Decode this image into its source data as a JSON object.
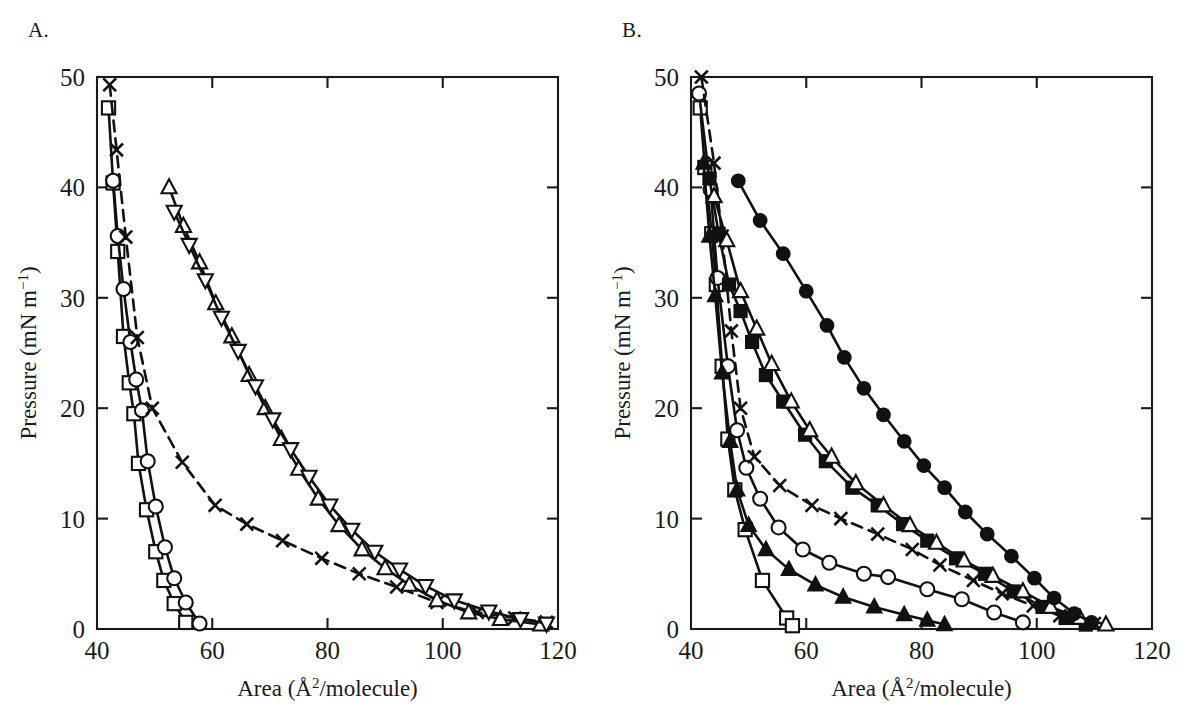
{
  "figure": {
    "background_color": "#ffffff",
    "ink_color": "#111111",
    "panels": [
      {
        "id": "A",
        "label": "A."
      },
      {
        "id": "B",
        "label": "B."
      }
    ]
  },
  "chart_data": [
    {
      "panel": "A",
      "type": "line",
      "title": "",
      "xlabel": "Area (Å²/molecule)",
      "xlabel_parts": {
        "pre": "Area (Å",
        "sup": "2",
        "post": "/molecule)"
      },
      "ylabel": "Pressure (mN m⁻¹)",
      "ylabel_parts": {
        "pre": "Pressure (mN m",
        "sup": "−1",
        "post": ")"
      },
      "xlim": [
        40,
        120
      ],
      "ylim": [
        0,
        50
      ],
      "xticks": [
        40,
        60,
        80,
        100,
        120
      ],
      "yticks": [
        0,
        10,
        20,
        30,
        40,
        50
      ],
      "grid": false,
      "legend": "none",
      "ticks_direction": "in",
      "frame": "box",
      "series": [
        {
          "name": "open-square-isotherm",
          "marker": "open-square",
          "linestyle": "solid",
          "points": [
            [
              42.0,
              47.2
            ],
            [
              42.8,
              40.4
            ],
            [
              43.6,
              34.2
            ],
            [
              44.6,
              26.5
            ],
            [
              45.6,
              22.3
            ],
            [
              46.4,
              19.5
            ],
            [
              47.2,
              15.0
            ],
            [
              48.6,
              10.8
            ],
            [
              50.2,
              7.0
            ],
            [
              51.6,
              4.4
            ],
            [
              53.4,
              2.3
            ],
            [
              55.4,
              0.6
            ]
          ]
        },
        {
          "name": "open-circle-isotherm",
          "marker": "open-circle",
          "linestyle": "solid",
          "points": [
            [
              42.8,
              40.6
            ],
            [
              43.6,
              35.6
            ],
            [
              44.6,
              30.8
            ],
            [
              45.8,
              26.0
            ],
            [
              46.8,
              22.6
            ],
            [
              47.8,
              19.8
            ],
            [
              48.8,
              15.2
            ],
            [
              50.2,
              11.1
            ],
            [
              51.8,
              7.4
            ],
            [
              53.4,
              4.6
            ],
            [
              55.4,
              2.4
            ],
            [
              57.8,
              0.5
            ]
          ]
        },
        {
          "name": "cross-isotherm",
          "marker": "cross",
          "linestyle": "dashed",
          "points": [
            [
              42.2,
              49.3
            ],
            [
              43.4,
              43.4
            ],
            [
              45.0,
              35.5
            ],
            [
              47.0,
              26.4
            ],
            [
              49.6,
              20.0
            ],
            [
              54.8,
              15.1
            ],
            [
              60.5,
              11.2
            ],
            [
              66.0,
              9.5
            ],
            [
              72.2,
              8.0
            ],
            [
              79.0,
              6.4
            ],
            [
              85.5,
              5.0
            ],
            [
              92.0,
              3.8
            ],
            [
              99.0,
              2.4
            ],
            [
              106.0,
              1.5
            ],
            [
              112.5,
              1.0
            ],
            [
              118.0,
              0.6
            ]
          ]
        },
        {
          "name": "open-up-triangle-isotherm",
          "marker": "open-triangle-up",
          "linestyle": "solid",
          "points": [
            [
              52.5,
              40.0
            ],
            [
              55.0,
              36.5
            ],
            [
              57.8,
              33.2
            ],
            [
              60.6,
              29.5
            ],
            [
              63.4,
              26.5
            ],
            [
              66.4,
              23.0
            ],
            [
              69.2,
              20.0
            ],
            [
              72.0,
              17.2
            ],
            [
              75.0,
              14.5
            ],
            [
              78.4,
              11.8
            ],
            [
              82.0,
              9.4
            ],
            [
              86.0,
              7.2
            ],
            [
              90.0,
              5.5
            ],
            [
              94.2,
              4.0
            ],
            [
              99.0,
              2.6
            ],
            [
              104.5,
              1.5
            ],
            [
              110.0,
              0.9
            ],
            [
              117.0,
              0.4
            ]
          ]
        },
        {
          "name": "open-down-triangle-isotherm",
          "marker": "open-triangle-down",
          "linestyle": "solid",
          "points": [
            [
              53.4,
              37.8
            ],
            [
              56.0,
              34.8
            ],
            [
              58.8,
              31.6
            ],
            [
              61.6,
              28.2
            ],
            [
              64.5,
              25.2
            ],
            [
              67.5,
              22.0
            ],
            [
              70.5,
              19.0
            ],
            [
              73.6,
              16.3
            ],
            [
              76.8,
              13.8
            ],
            [
              80.4,
              11.2
            ],
            [
              84.2,
              9.0
            ],
            [
              88.2,
              7.0
            ],
            [
              92.5,
              5.4
            ],
            [
              97.0,
              3.9
            ],
            [
              102.0,
              2.6
            ],
            [
              108.0,
              1.6
            ],
            [
              113.5,
              0.9
            ],
            [
              118.0,
              0.5
            ]
          ]
        }
      ]
    },
    {
      "panel": "B",
      "type": "line",
      "title": "",
      "xlabel": "Area (Å²/molecule)",
      "xlabel_parts": {
        "pre": "Area (Å",
        "sup": "2",
        "post": "/molecule)"
      },
      "ylabel": "Pressure (mN m⁻¹)",
      "ylabel_parts": {
        "pre": "Pressure (mN m",
        "sup": "−1",
        "post": ")"
      },
      "xlim": [
        40,
        120
      ],
      "ylim": [
        0,
        50
      ],
      "xticks": [
        40,
        60,
        80,
        100,
        120
      ],
      "yticks": [
        0,
        10,
        20,
        30,
        40,
        50
      ],
      "grid": false,
      "legend": "none",
      "ticks_direction": "in",
      "frame": "box",
      "series": [
        {
          "name": "open-square-isotherm",
          "marker": "open-square",
          "linestyle": "solid",
          "points": [
            [
              41.6,
              47.2
            ],
            [
              42.4,
              41.8
            ],
            [
              43.6,
              35.8
            ],
            [
              44.4,
              31.2
            ],
            [
              45.4,
              23.8
            ],
            [
              46.4,
              17.2
            ],
            [
              47.6,
              12.6
            ],
            [
              49.4,
              9.0
            ],
            [
              52.4,
              4.4
            ],
            [
              56.6,
              1.0
            ],
            [
              57.6,
              0.3
            ]
          ]
        },
        {
          "name": "open-circle-isotherm",
          "marker": "open-circle",
          "linestyle": "solid",
          "points": [
            [
              41.4,
              48.5
            ],
            [
              43.4,
              39.8
            ],
            [
              44.6,
              31.8
            ],
            [
              46.4,
              23.8
            ],
            [
              48.0,
              18.0
            ],
            [
              49.6,
              14.6
            ],
            [
              52.0,
              11.8
            ],
            [
              55.2,
              9.2
            ],
            [
              59.4,
              7.2
            ],
            [
              64.0,
              6.0
            ],
            [
              70.0,
              5.0
            ],
            [
              74.2,
              4.7
            ],
            [
              81.0,
              3.6
            ],
            [
              87.0,
              2.7
            ],
            [
              92.6,
              1.5
            ],
            [
              97.6,
              0.6
            ]
          ]
        },
        {
          "name": "cross-isotherm",
          "marker": "cross",
          "linestyle": "dashed",
          "points": [
            [
              41.8,
              50.0
            ],
            [
              44.0,
              42.2
            ],
            [
              45.4,
              35.6
            ],
            [
              47.0,
              27.0
            ],
            [
              48.6,
              20.0
            ],
            [
              51.0,
              15.6
            ],
            [
              55.4,
              13.0
            ],
            [
              61.0,
              11.2
            ],
            [
              66.0,
              10.0
            ],
            [
              72.4,
              8.6
            ],
            [
              78.4,
              7.2
            ],
            [
              83.2,
              5.8
            ],
            [
              89.0,
              4.4
            ],
            [
              94.0,
              3.2
            ],
            [
              99.4,
              2.1
            ],
            [
              104.0,
              1.2
            ],
            [
              110.0,
              0.5
            ]
          ]
        },
        {
          "name": "filled-triangle-isotherm",
          "marker": "filled-triangle-up",
          "linestyle": "solid",
          "points": [
            [
              42.2,
              42.2
            ],
            [
              43.2,
              35.6
            ],
            [
              44.2,
              30.2
            ],
            [
              45.4,
              23.2
            ],
            [
              46.8,
              17.0
            ],
            [
              48.0,
              12.6
            ],
            [
              50.0,
              9.4
            ],
            [
              53.0,
              7.2
            ],
            [
              57.0,
              5.4
            ],
            [
              61.6,
              4.0
            ],
            [
              66.4,
              2.9
            ],
            [
              71.8,
              2.0
            ],
            [
              77.0,
              1.3
            ],
            [
              81.0,
              0.8
            ],
            [
              84.0,
              0.4
            ]
          ]
        },
        {
          "name": "filled-square-isotherm",
          "marker": "filled-square",
          "linestyle": "solid",
          "points": [
            [
              43.2,
              40.8
            ],
            [
              44.8,
              35.8
            ],
            [
              46.6,
              31.2
            ],
            [
              48.6,
              28.8
            ],
            [
              50.6,
              26.0
            ],
            [
              53.0,
              23.0
            ],
            [
              56.0,
              20.6
            ],
            [
              59.8,
              17.6
            ],
            [
              63.4,
              15.2
            ],
            [
              68.0,
              12.8
            ],
            [
              72.4,
              11.2
            ],
            [
              76.8,
              9.5
            ],
            [
              81.0,
              8.0
            ],
            [
              86.0,
              6.4
            ],
            [
              91.0,
              5.0
            ],
            [
              96.0,
              3.4
            ],
            [
              101.0,
              2.0
            ],
            [
              105.0,
              1.0
            ],
            [
              108.5,
              0.4
            ]
          ]
        },
        {
          "name": "open-triangle-isotherm",
          "marker": "open-triangle-up",
          "linestyle": "solid",
          "points": [
            [
              44.0,
              39.2
            ],
            [
              46.2,
              35.2
            ],
            [
              48.6,
              30.6
            ],
            [
              51.4,
              27.2
            ],
            [
              54.0,
              24.0
            ],
            [
              57.4,
              20.6
            ],
            [
              60.6,
              18.0
            ],
            [
              64.4,
              15.6
            ],
            [
              68.6,
              13.2
            ],
            [
              73.4,
              11.2
            ],
            [
              78.0,
              9.4
            ],
            [
              82.6,
              7.8
            ],
            [
              87.4,
              6.2
            ],
            [
              92.4,
              4.8
            ],
            [
              97.6,
              3.4
            ],
            [
              102.4,
              2.0
            ],
            [
              107.5,
              1.0
            ],
            [
              112.0,
              0.4
            ]
          ]
        },
        {
          "name": "filled-circle-isotherm",
          "marker": "filled-circle",
          "linestyle": "solid",
          "points": [
            [
              48.2,
              40.6
            ],
            [
              52.0,
              37.0
            ],
            [
              56.0,
              34.0
            ],
            [
              60.0,
              30.6
            ],
            [
              63.6,
              27.5
            ],
            [
              66.6,
              24.6
            ],
            [
              70.0,
              21.8
            ],
            [
              73.4,
              19.4
            ],
            [
              77.0,
              17.0
            ],
            [
              80.4,
              14.8
            ],
            [
              84.0,
              12.8
            ],
            [
              87.6,
              10.6
            ],
            [
              91.4,
              8.6
            ],
            [
              95.6,
              6.6
            ],
            [
              99.6,
              4.6
            ],
            [
              103.0,
              2.8
            ],
            [
              106.5,
              1.4
            ],
            [
              109.5,
              0.6
            ]
          ]
        }
      ]
    }
  ]
}
